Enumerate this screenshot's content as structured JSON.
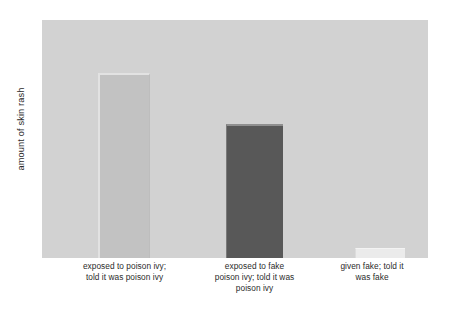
{
  "chart_data": {
    "type": "bar",
    "title": "",
    "subtitle": "",
    "xlabel": "",
    "ylabel": "amount of skin rash",
    "categories": [
      "exposed to poison ivy;\ntold it was poison ivy",
      "exposed to fake\npoison ivy; told it was\npoison ivy",
      "given fake; told it\nwas fake"
    ],
    "category_lines": [
      [
        "exposed to poison ivy;",
        "told it was poison ivy"
      ],
      [
        "exposed to fake",
        "poison ivy; told it was",
        "poison ivy"
      ],
      [
        "given fake; told it",
        "was fake"
      ]
    ],
    "values": [
      185,
      134,
      10
    ],
    "ylim": [
      0,
      238
    ],
    "grid": false,
    "legend": null,
    "tick_labels_y": [],
    "bar_colors": [
      "#c2c2c2",
      "#585858",
      "#ebebeb"
    ],
    "plot_background": "#d2d2d2",
    "figure_background": "#ffffff",
    "text_color": "#2b2b2b"
  },
  "axes": {
    "y_title": "amount of skin rash"
  }
}
